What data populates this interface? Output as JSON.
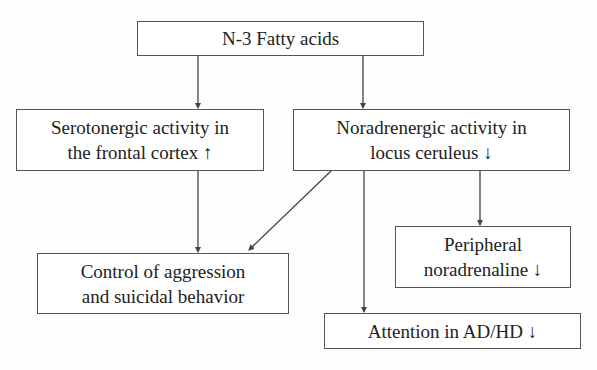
{
  "diagram": {
    "nodes": [
      {
        "id": "n3",
        "label": "N-3 Fatty acids"
      },
      {
        "id": "sero",
        "label": "Serotonergic activity in\nthe frontal cortex ↑"
      },
      {
        "id": "nora",
        "label": "Noradrenergic activity in\nlocus ceruleus ↓"
      },
      {
        "id": "control",
        "label": "Control of aggression\nand suicidal behavior"
      },
      {
        "id": "periph",
        "label": "Peripheral\nnoradrenaline ↓"
      },
      {
        "id": "attention",
        "label": "Attention in AD/HD ↓"
      }
    ],
    "edges": [
      {
        "from": "n3",
        "to": "sero"
      },
      {
        "from": "n3",
        "to": "nora"
      },
      {
        "from": "sero",
        "to": "control"
      },
      {
        "from": "nora",
        "to": "control"
      },
      {
        "from": "nora",
        "to": "attention"
      },
      {
        "from": "nora",
        "to": "periph"
      }
    ]
  },
  "colors": {
    "line": "#444444",
    "background": "#ffffff"
  }
}
